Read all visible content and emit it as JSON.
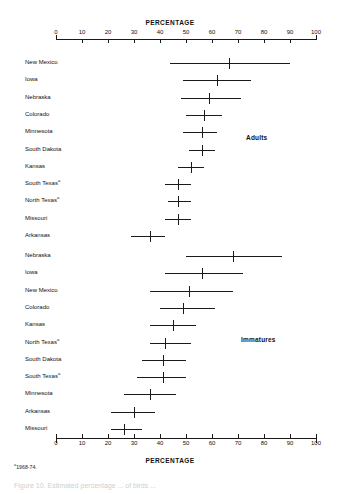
{
  "figure": {
    "axis_title_top": "PERCENTAGE",
    "axis_title_bottom": "PERCENTAGE",
    "group_label_adults": "Adults",
    "group_label_immatures": "Immatures",
    "footnote_marker": "a",
    "footnote_text": "1968-74.",
    "caption_partial": "Figure 10. Estimated percentage ... of birds ..."
  },
  "chart_data": {
    "type": "scatter",
    "title": "",
    "xlabel": "PERCENTAGE",
    "ylabel": "",
    "xlim": [
      0,
      100
    ],
    "grid": false,
    "legend": "none",
    "tick_labels": [
      "0",
      "10",
      "20",
      "30",
      "40",
      "50",
      "60",
      "70",
      "80",
      "90",
      "100"
    ],
    "tick_values": [
      0,
      10,
      20,
      30,
      40,
      50,
      60,
      70,
      80,
      90,
      100
    ],
    "notation": "point estimate with horizontal confidence interval (low-high)",
    "groups": [
      {
        "name": "Adults",
        "points": [
          {
            "label": "New Mexico",
            "footnote": "",
            "low": 44,
            "value": 66.5,
            "high": 90
          },
          {
            "label": "Iowa",
            "footnote": "",
            "low": 49,
            "value": 62,
            "high": 75
          },
          {
            "label": "Nebraska",
            "footnote": "",
            "low": 48,
            "value": 59,
            "high": 71
          },
          {
            "label": "Colorado",
            "footnote": "",
            "low": 50,
            "value": 57,
            "high": 64
          },
          {
            "label": "Minnesota",
            "footnote": "",
            "low": 49,
            "value": 56,
            "high": 62
          },
          {
            "label": "South Dakota",
            "footnote": "",
            "low": 51,
            "value": 56,
            "high": 61
          },
          {
            "label": "Kansas",
            "footnote": "",
            "low": 47,
            "value": 52,
            "high": 57
          },
          {
            "label": "South Texas",
            "footnote": "a",
            "low": 42,
            "value": 47,
            "high": 52
          },
          {
            "label": "North Texas",
            "footnote": "a",
            "low": 43,
            "value": 47,
            "high": 52
          },
          {
            "label": "Missouri",
            "footnote": "",
            "low": 42,
            "value": 47,
            "high": 52
          },
          {
            "label": "Arkansas",
            "footnote": "",
            "low": 29,
            "value": 36,
            "high": 42
          }
        ]
      },
      {
        "name": "Immatures",
        "points": [
          {
            "label": "Nebraska",
            "footnote": "",
            "low": 50,
            "value": 68,
            "high": 87
          },
          {
            "label": "Iowa",
            "footnote": "",
            "low": 42,
            "value": 56,
            "high": 72
          },
          {
            "label": "New Mexico",
            "footnote": "",
            "low": 36,
            "value": 51,
            "high": 68
          },
          {
            "label": "Colorado",
            "footnote": "",
            "low": 40,
            "value": 49,
            "high": 61
          },
          {
            "label": "Kansas",
            "footnote": "",
            "low": 36,
            "value": 45,
            "high": 54
          },
          {
            "label": "North Texas",
            "footnote": "a",
            "low": 36,
            "value": 42,
            "high": 52
          },
          {
            "label": "South Dakota",
            "footnote": "",
            "low": 33,
            "value": 41,
            "high": 50
          },
          {
            "label": "South Texas",
            "footnote": "a",
            "low": 31,
            "value": 41,
            "high": 50
          },
          {
            "label": "Minnesota",
            "footnote": "",
            "low": 26,
            "value": 36,
            "high": 46
          },
          {
            "label": "Arkansas",
            "footnote": "",
            "low": 21,
            "value": 30,
            "high": 38
          },
          {
            "label": "Missouri",
            "footnote": "",
            "low": 21,
            "value": 26,
            "high": 33
          }
        ]
      }
    ]
  }
}
